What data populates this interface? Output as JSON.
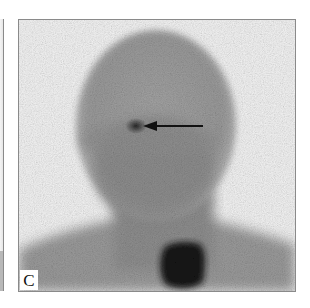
{
  "figure": {
    "type": "scintigraphy-scan",
    "view": "anterior head and neck",
    "panel_label": "C",
    "previous_panel_partial": true,
    "colors": {
      "background": "#f7f7f7",
      "border": "#8a8a8a",
      "head_tone": "#8c8c8c",
      "hotspot": "#2a2a2a",
      "thyroid": "#141414",
      "arrow": "#111111"
    },
    "annotations": [
      {
        "type": "arrow",
        "direction": "left",
        "target": "focal uptake",
        "description": "arrow pointing to focal hot spot in head"
      }
    ]
  }
}
